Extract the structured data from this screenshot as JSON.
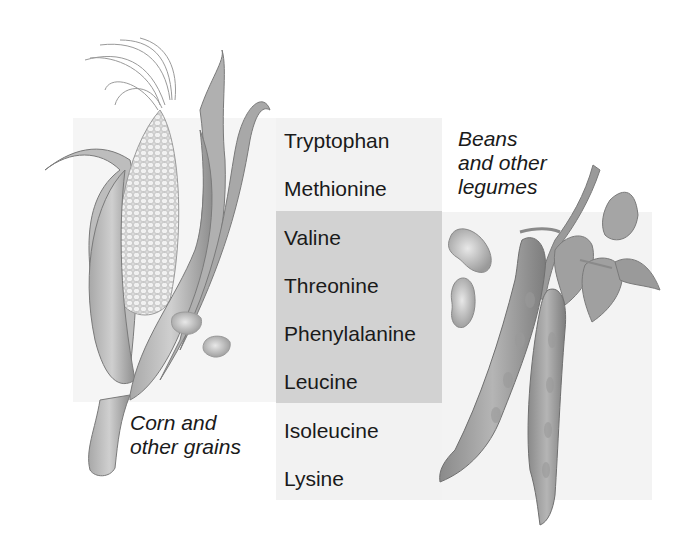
{
  "figure": {
    "amino_acids": [
      {
        "name": "Tryptophan",
        "highlighted": false
      },
      {
        "name": "Methionine",
        "highlighted": false
      },
      {
        "name": "Valine",
        "highlighted": true
      },
      {
        "name": "Threonine",
        "highlighted": true
      },
      {
        "name": "Phenylalanine",
        "highlighted": true
      },
      {
        "name": "Leucine",
        "highlighted": true
      },
      {
        "name": "Isoleucine",
        "highlighted": false
      },
      {
        "name": "Lysine",
        "highlighted": false
      }
    ],
    "captions": {
      "corn": {
        "line1": "Corn and",
        "line2": "other grains"
      },
      "beans": {
        "line1": "Beans",
        "line2": "and other",
        "line3": "legumes"
      }
    },
    "illustrations": {
      "left": "corn-ear-icon",
      "left_kernels": "corn-kernel-icon",
      "right": "bean-pod-plant-icon",
      "right_seeds": "bean-seed-icon"
    },
    "colors": {
      "highlight_band": "#d2d2d2",
      "panel_light": "#f3f3f3",
      "text": "#1a1a1a",
      "illustration_gray": "#8a8a8a"
    }
  }
}
